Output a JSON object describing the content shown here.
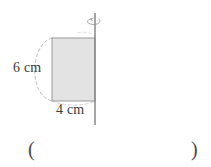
{
  "figure": {
    "axis": {
      "name": "rotation-axis",
      "orientation": "vertical",
      "x": 95,
      "y_top": 13,
      "y_bottom": 125,
      "color": "#808080"
    },
    "rotation_arrow": {
      "name": "rotation-arrow",
      "description": "curved arrow around axis indicating revolution",
      "color": "#8c8c8c"
    },
    "rectangle": {
      "name": "shaded-rectangle",
      "left": 52,
      "top": 38,
      "right": 95,
      "bottom": 101,
      "width_px": 43,
      "height_px": 63,
      "fill": "#e3e3e3",
      "stroke": "#9a9a9a"
    },
    "revolution_arc": {
      "name": "dashed-revolution-arc",
      "style": "dashed",
      "color": "#b0b0b0",
      "description": "dashed elliptical arc from top-left to bottom-left corner"
    },
    "labels": {
      "height": "6 cm",
      "width": "4 cm"
    }
  },
  "answer": {
    "open_paren": "(",
    "close_paren": ")",
    "value": "",
    "placeholder": ""
  },
  "colors": {
    "fill": "#e3e3e3",
    "stroke": "#9a9a9a",
    "dashed": "#b0b0b0",
    "axis": "#808080",
    "text": "#3a3a3a",
    "background": "#ffffff"
  }
}
